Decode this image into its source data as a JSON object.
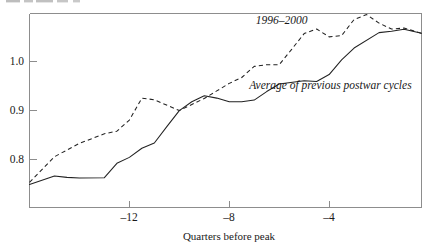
{
  "chart_data": {
    "type": "line",
    "title": "",
    "subtitle": "",
    "xlabel": "Quarters before peak",
    "ylabel": "",
    "xlim": [
      -16,
      -0.3
    ],
    "ylim": [
      0.7405,
      1.0367
    ],
    "xticks": [
      -12,
      -8,
      -4
    ],
    "xticklabels": [
      "–12",
      "–8",
      "–4"
    ],
    "yticks": [
      0.8,
      0.9,
      1.0
    ],
    "yticklabels": [
      "0.8",
      "0.9",
      "1.0"
    ],
    "grid": false,
    "legend": "inline-annotations",
    "series": [
      {
        "name": "1996–2000",
        "style": "dashed",
        "color": "#222222",
        "label_x": -5.9,
        "label_y": 1.0215,
        "x": [
          -16.0,
          -15.0,
          -14.0,
          -13.0,
          -12.5,
          -12.0,
          -11.5,
          -11.0,
          -10.0,
          -9.0,
          -8.5,
          -8.0,
          -7.5,
          -7.0,
          -6.5,
          -6.0,
          -5.5,
          -5.0,
          -4.5,
          -4.0,
          -3.5,
          -3.0,
          -2.5,
          -2.0,
          -1.5,
          -1.0,
          -0.3
        ],
        "y": [
          0.779,
          0.818,
          0.8385,
          0.853,
          0.857,
          0.874,
          0.9075,
          0.905,
          0.8885,
          0.907,
          0.9185,
          0.93,
          0.939,
          0.956,
          0.9585,
          0.9585,
          0.982,
          1.006,
          1.013,
          1.001,
          1.003,
          1.0275,
          1.035,
          1.022,
          1.013,
          1.0145,
          1.0065
        ]
      },
      {
        "name": "Average of previous postwar cycles",
        "style": "solid",
        "color": "#222222",
        "label_x": -7.2,
        "label_y": 0.9215,
        "x": [
          -16.0,
          -15.0,
          -14.5,
          -14.0,
          -13.0,
          -12.5,
          -12.0,
          -11.5,
          -11.0,
          -10.5,
          -10.0,
          -9.5,
          -9.0,
          -8.5,
          -8.0,
          -7.5,
          -7.0,
          -6.5,
          -6.0,
          -5.0,
          -4.5,
          -4.0,
          -3.5,
          -3.0,
          -2.0,
          -1.5,
          -1.0,
          -0.3
        ],
        "y": [
          0.7755,
          0.7885,
          0.7865,
          0.7855,
          0.786,
          0.808,
          0.817,
          0.831,
          0.839,
          0.864,
          0.8885,
          0.902,
          0.911,
          0.9075,
          0.902,
          0.902,
          0.9045,
          0.9175,
          0.929,
          0.934,
          0.933,
          0.9435,
          0.966,
          0.984,
          1.0075,
          1.0095,
          1.0125,
          1.0065
        ]
      }
    ]
  },
  "axes": {
    "x_axis_title": "Quarters before peak",
    "tick_labels_x": [
      "–12",
      "–8",
      "–4"
    ],
    "tick_labels_y": [
      "1.0",
      "0.9",
      "0.8"
    ]
  },
  "annotations": {
    "dashed_series_label": "1996–2000",
    "solid_series_label": "Average of previous postwar cycles"
  },
  "colors": {
    "line": "#222222",
    "frame": "#8d8d8d",
    "text": "#1a1a1a",
    "background": "#ffffff"
  }
}
